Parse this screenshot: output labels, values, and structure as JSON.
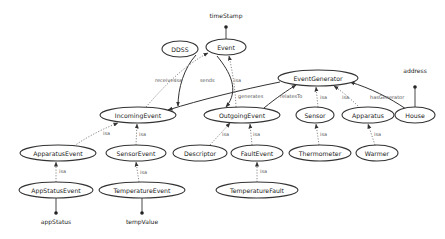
{
  "diagram": {
    "title": "",
    "colors": {
      "node_stroke": "#333333",
      "solid_edge": "#333333",
      "dotted_edge": "#888888",
      "text": "#222222",
      "background": "#ffffff"
    },
    "nodes": [
      {
        "id": "DDSS",
        "label": "DDSS",
        "cx": 209,
        "cy": 49,
        "rx": 18,
        "ry": 8
      },
      {
        "id": "Event",
        "label": "Event",
        "cx": 226,
        "cy": 47,
        "rx": 20,
        "ry": 8
      },
      {
        "id": "EventGenerator",
        "label": "EventGenerator",
        "cx": 318,
        "cy": 78,
        "rx": 40,
        "ry": 8
      },
      {
        "id": "IncomingEvent",
        "label": "IncomingEvent",
        "cx": 138,
        "cy": 115,
        "rx": 38,
        "ry": 8
      },
      {
        "id": "OutgoingEvent",
        "label": "OutgoingEvent",
        "cx": 242,
        "cy": 115,
        "rx": 38,
        "ry": 8
      },
      {
        "id": "Sensor",
        "label": "Sensor",
        "cx": 325,
        "cy": 115,
        "rx": 19,
        "ry": 8
      },
      {
        "id": "Apparatus",
        "label": "Apparatus",
        "cx": 372,
        "cy": 115,
        "rx": 26,
        "ry": 8
      },
      {
        "id": "House",
        "label": "House",
        "cx": 418,
        "cy": 115,
        "rx": 20,
        "ry": 8
      },
      {
        "id": "ApparatusEvent",
        "label": "ApparatusEvent",
        "cx": 58,
        "cy": 153,
        "rx": 38,
        "ry": 8
      },
      {
        "id": "SensorEvent",
        "label": "SensorEvent",
        "cx": 136,
        "cy": 153,
        "rx": 30,
        "ry": 8
      },
      {
        "id": "Descriptor",
        "label": "Descriptor",
        "cx": 203,
        "cy": 153,
        "rx": 27,
        "ry": 8
      },
      {
        "id": "FaultEvent",
        "label": "FaultEvent",
        "cx": 257,
        "cy": 153,
        "rx": 26,
        "ry": 8
      },
      {
        "id": "Thermometer",
        "label": "Thermometer",
        "cx": 326,
        "cy": 153,
        "rx": 31,
        "ry": 8
      },
      {
        "id": "Warmer",
        "label": "Warmer",
        "cx": 374,
        "cy": 153,
        "rx": 21,
        "ry": 8
      },
      {
        "id": "AppStatusEvent",
        "label": "AppStatusEvent",
        "cx": 56,
        "cy": 190,
        "rx": 37,
        "ry": 8
      },
      {
        "id": "TemperatureEvent",
        "label": "TemperatureEvent",
        "cx": 142,
        "cy": 190,
        "rx": 43,
        "ry": 8
      },
      {
        "id": "TemperatureFault",
        "label": "TemperatureFault",
        "cx": 257,
        "cy": 190,
        "rx": 41,
        "ry": 8
      }
    ],
    "attributes": [
      {
        "id": "timeStamp",
        "label": "timeStamp",
        "owner": "Event"
      },
      {
        "id": "address",
        "label": "address",
        "owner": "House"
      },
      {
        "id": "appStatus",
        "label": "appStatus",
        "owner": "AppStatusEvent"
      },
      {
        "id": "tempValue",
        "label": "tempValue",
        "owner": "TemperatureEvent"
      }
    ],
    "edges": [
      {
        "from": "DDSS",
        "to": "IncomingEvent",
        "label": "receives",
        "style": "solid"
      },
      {
        "from": "DDSS",
        "to": "OutgoingEvent",
        "label": "sends",
        "style": "solid"
      },
      {
        "from": "IncomingEvent",
        "to": "Event",
        "label": "isa",
        "style": "dotted"
      },
      {
        "from": "OutgoingEvent",
        "to": "Event",
        "label": "isa",
        "style": "dotted"
      },
      {
        "from": "EventGenerator",
        "to": "IncomingEvent",
        "label": "generates",
        "style": "solid"
      },
      {
        "from": "OutgoingEvent",
        "to": "EventGenerator",
        "label": "relatesTo",
        "style": "solid"
      },
      {
        "from": "Sensor",
        "to": "EventGenerator",
        "label": "isa",
        "style": "dotted"
      },
      {
        "from": "Apparatus",
        "to": "EventGenerator",
        "label": "isa",
        "style": "dotted"
      },
      {
        "from": "House",
        "to": "EventGenerator",
        "label": "hasGenerator",
        "style": "solid"
      },
      {
        "from": "ApparatusEvent",
        "to": "IncomingEvent",
        "label": "isa",
        "style": "dotted"
      },
      {
        "from": "SensorEvent",
        "to": "IncomingEvent",
        "label": "isa",
        "style": "dotted"
      },
      {
        "from": "Descriptor",
        "to": "OutgoingEvent",
        "label": "isa",
        "style": "dotted"
      },
      {
        "from": "FaultEvent",
        "to": "OutgoingEvent",
        "label": "isa",
        "style": "dotted"
      },
      {
        "from": "Thermometer",
        "to": "Sensor",
        "label": "isa",
        "style": "dotted"
      },
      {
        "from": "Warmer",
        "to": "Apparatus",
        "label": "isa",
        "style": "dotted"
      },
      {
        "from": "AppStatusEvent",
        "to": "ApparatusEvent",
        "label": "isa",
        "style": "dotted"
      },
      {
        "from": "TemperatureEvent",
        "to": "SensorEvent",
        "label": "isa",
        "style": "dotted"
      },
      {
        "from": "TemperatureFault",
        "to": "FaultEvent",
        "label": "isa",
        "style": "dotted"
      }
    ]
  }
}
